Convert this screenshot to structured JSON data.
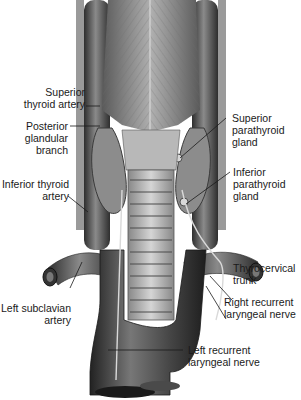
{
  "figure": {
    "colors": {
      "background": "#ffffff",
      "tissue_dark": "#3a3a3a",
      "tissue_mid": "#7a7a7a",
      "tissue_light": "#bdbdbd",
      "text": "#1a1a1a"
    }
  },
  "labels": {
    "superior_thyroid_artery": [
      "Superior",
      "thyroid artery"
    ],
    "posterior_glandular_branch": [
      "Posterior",
      "glandular",
      "branch"
    ],
    "inferior_thyroid_artery": [
      "Inferior thyroid",
      "artery"
    ],
    "left_subclavian_artery": [
      "Left subclavian",
      "artery"
    ],
    "superior_parathyroid_gland": [
      "Superior",
      "parathyroid",
      "gland"
    ],
    "inferior_parathyroid_gland": [
      "Inferior",
      "parathyroid",
      "gland"
    ],
    "thyrocervical_trunk": [
      "Thyrocervical",
      "trunk"
    ],
    "right_recurrent_laryngeal_nerve": [
      "Right recurrent",
      "laryngeal nerve"
    ],
    "left_recurrent_laryngeal_nerve": [
      "Left recurrent",
      "laryngeal nerve"
    ]
  }
}
